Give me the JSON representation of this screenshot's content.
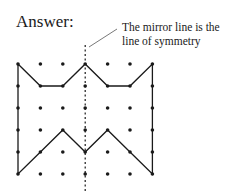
{
  "heading": "Answer:",
  "annotation": {
    "line1": "The mirror line is the",
    "line2": "line of symmetry"
  },
  "grid": {
    "cols": 7,
    "rows": 6,
    "origin": [
      18,
      64
    ],
    "dx": 22.4,
    "dy": 22
  },
  "shape_points": [
    [
      0,
      0
    ],
    [
      1,
      1
    ],
    [
      2,
      1
    ],
    [
      3,
      0
    ],
    [
      4,
      1
    ],
    [
      5,
      1
    ],
    [
      6,
      0
    ],
    [
      6,
      5
    ],
    [
      5,
      4
    ],
    [
      4,
      3
    ],
    [
      3,
      4
    ],
    [
      2,
      3
    ],
    [
      1,
      4
    ],
    [
      0,
      5
    ]
  ],
  "mirror_line": {
    "x_col": 3,
    "y_start": 45,
    "y_end": 192
  },
  "leader": {
    "x1": 89,
    "y1": 47,
    "x2": 117,
    "y2": 29
  },
  "colors": {
    "ink": "#1a1a1a"
  }
}
